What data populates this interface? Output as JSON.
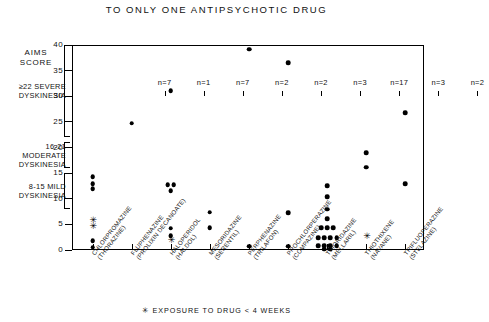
{
  "chart_data": {
    "type": "scatter",
    "title": "TO ONLY ONE ANTIPSYCHOTIC DRUG",
    "ylabel": "AIMS SCORE",
    "xlabel": "",
    "ylim": [
      0,
      40
    ],
    "yticks": [
      0,
      5,
      10,
      15,
      20,
      25,
      30,
      35,
      40
    ],
    "grid": false,
    "legend": "",
    "footnote": "EXPOSURE TO DRUG < 4 WEEKS",
    "footnote_marker": "✳",
    "severity_bands": [
      {
        "label_line1": "≥22 SEVERE",
        "label_line2": "DYSKINESIA",
        "range": [
          22,
          40
        ]
      },
      {
        "label_line1": "16-21",
        "label_line2": "MODERATE",
        "label_line3": "DYSKINESIA",
        "range": [
          16,
          21
        ]
      },
      {
        "label_line1": "8-15 MILD",
        "label_line2": "DYSKINESIA",
        "range": [
          8,
          15
        ]
      }
    ],
    "categories": [
      "CHLORPROMAZINE (THORAZINE)",
      "FLUPHENAZINE (PROLIXIN DECANOATE)",
      "HALOPERIDOL (HALDOL)",
      "MESORIDAZINE (SERENTIL)",
      "PERPHENAZINE (TRILAFON)",
      "PROCHLORPERAZINE (COMPAZINE)",
      "THIORIDAZINE (MELLARIL)",
      "THIOTHIXENE (NAVANE)",
      "TRIFLUOPERAZINE (STELAZINE)"
    ],
    "counts": [
      "n=7",
      "n=1",
      "n=7",
      "n=2",
      "n=2",
      "n=3",
      "n=17",
      "n=3",
      "n=2"
    ],
    "groups": [
      {
        "name": "CHLORPROMAZINE",
        "generic": "CHLORPROMAZINE",
        "brand": "(THORAZINE)",
        "count_label": "n=7",
        "values": [
          14.5,
          13.2,
          12.2,
          6.2,
          5.0,
          2.0,
          0.8
        ],
        "short_exposure": [
          false,
          false,
          false,
          true,
          true,
          false,
          false
        ]
      },
      {
        "name": "FLUPHENAZINE",
        "generic": "FLUPHENAZINE",
        "brand": "(PROLIXIN DECANOATE)",
        "count_label": "n=1",
        "values": [
          25.0
        ],
        "short_exposure": [
          false
        ]
      },
      {
        "name": "HALOPERIDOL",
        "generic": "HALOPERIDOL",
        "brand": "(HALDOL)",
        "count_label": "n=7",
        "values": [
          31.3,
          13.0,
          13.0,
          11.8,
          4.5,
          3.0,
          2.2
        ],
        "short_exposure": [
          false,
          false,
          false,
          false,
          false,
          false,
          true
        ]
      },
      {
        "name": "MESORIDAZINE",
        "generic": "MESORIDAZINE",
        "brand": "(SERENTIL)",
        "count_label": "n=2",
        "values": [
          7.6,
          4.6
        ],
        "short_exposure": [
          false,
          false
        ]
      },
      {
        "name": "PERPHENAZINE",
        "generic": "PERPHENAZINE",
        "brand": "(TRILAFON)",
        "count_label": "n=2",
        "values": [
          39.4,
          1.0
        ],
        "short_exposure": [
          false,
          false
        ]
      },
      {
        "name": "PROCHLORPERAZINE",
        "generic": "PROCHLORPERAZINE",
        "brand": "(COMPAZINE)",
        "count_label": "n=3",
        "values": [
          36.8,
          7.5,
          1.0
        ],
        "short_exposure": [
          false,
          false,
          false
        ]
      },
      {
        "name": "THIORIDAZINE",
        "generic": "THIORIDAZINE",
        "brand": "(MELLARIL)",
        "count_label": "n=17",
        "values": [
          12.8,
          10.6,
          8.2,
          6.3,
          4.6,
          4.6,
          4.6,
          2.6,
          2.6,
          2.6,
          2.6,
          1.1,
          1.1,
          1.1,
          1.1,
          0.4,
          0.4
        ],
        "short_exposure": [
          false,
          false,
          false,
          false,
          false,
          false,
          false,
          false,
          false,
          false,
          false,
          false,
          false,
          false,
          false,
          false,
          false
        ]
      },
      {
        "name": "THIOTHIXENE",
        "generic": "THIOTHIXENE",
        "brand": "(NAVANE)",
        "count_label": "n=3",
        "values": [
          19.2,
          16.4,
          3.0
        ],
        "short_exposure": [
          false,
          false,
          true
        ]
      },
      {
        "name": "TRIFLUOPERAZINE",
        "generic": "TRIFLUOPERAZINE",
        "brand": "(STELAZINE)",
        "count_label": "n=2",
        "values": [
          27.0,
          13.2
        ],
        "short_exposure": [
          false,
          false
        ]
      }
    ]
  }
}
